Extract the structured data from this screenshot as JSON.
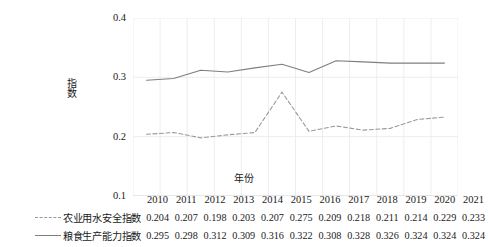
{
  "chart_data": {
    "type": "line",
    "title": "",
    "xlabel": "年份",
    "ylabel": "指数",
    "categories": [
      "2010",
      "2011",
      "2012",
      "2013",
      "2014",
      "2015",
      "2016",
      "2017",
      "2018",
      "2019",
      "2020",
      "2021"
    ],
    "ylim": [
      0.1,
      0.4
    ],
    "yticks": [
      "0.1",
      "0.2",
      "0.3",
      "0.4"
    ],
    "grid": "vertical-and-horizontal-light",
    "legend_position": "table-row-head",
    "series": [
      {
        "name": "农业用水安全指数",
        "style": "dashed",
        "color": "#9a9a9a",
        "values": [
          0.204,
          0.207,
          0.198,
          0.203,
          0.207,
          0.275,
          0.209,
          0.218,
          0.211,
          0.214,
          0.229,
          0.233
        ]
      },
      {
        "name": "粮食生产能力指数",
        "style": "solid",
        "color": "#7f7f7f",
        "values": [
          0.295,
          0.298,
          0.312,
          0.309,
          0.316,
          0.322,
          0.308,
          0.328,
          0.326,
          0.324,
          0.324,
          0.324
        ]
      }
    ]
  },
  "axis": {
    "y_title": "指数",
    "x_title": "年份",
    "y_tick_top": "0.4",
    "y_tick_3": "0.3",
    "y_tick_2": "0.2",
    "y_tick_bottom": "0.1"
  }
}
